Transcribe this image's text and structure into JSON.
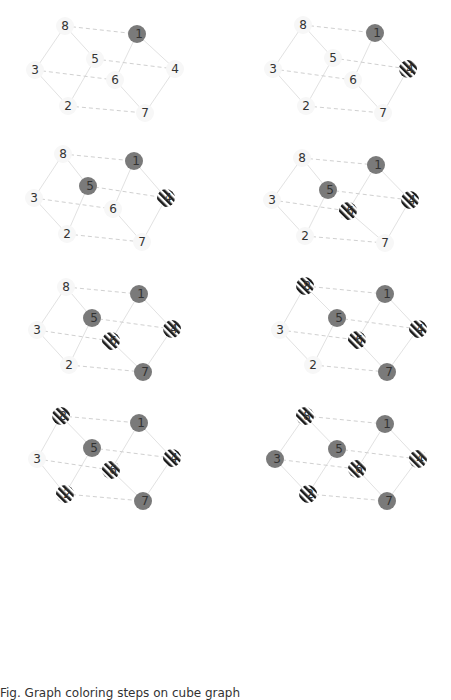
{
  "figure": {
    "caption": "Fig. Graph coloring steps on cube graph",
    "node_colors": {
      "filled": "#7a7a7a",
      "stripe_dark": "#1a1a1a",
      "stripe_light": "#ffffff",
      "halo": "#f7f7f7"
    },
    "edge_colors": {
      "solid": "#e2e2e2",
      "dashed": "#d0d0d0"
    },
    "edges": [
      {
        "from": "8",
        "to": "3",
        "style": "solid"
      },
      {
        "from": "8",
        "to": "5",
        "style": "solid"
      },
      {
        "from": "1",
        "to": "6",
        "style": "solid"
      },
      {
        "from": "1",
        "to": "4",
        "style": "solid"
      },
      {
        "from": "5",
        "to": "2",
        "style": "solid"
      },
      {
        "from": "3",
        "to": "2",
        "style": "solid"
      },
      {
        "from": "6",
        "to": "7",
        "style": "solid"
      },
      {
        "from": "4",
        "to": "7",
        "style": "solid"
      },
      {
        "from": "8",
        "to": "1",
        "style": "dashed"
      },
      {
        "from": "5",
        "to": "4",
        "style": "dashed"
      },
      {
        "from": "3",
        "to": "6",
        "style": "dashed"
      },
      {
        "from": "2",
        "to": "7",
        "style": "dashed"
      }
    ],
    "panels": [
      {
        "step": 1,
        "pos": {
          "8": [
            65,
            26
          ],
          "1": [
            137,
            34
          ],
          "5": [
            95,
            59
          ],
          "4": [
            175,
            69
          ],
          "3": [
            35,
            70
          ],
          "6": [
            115,
            80
          ],
          "2": [
            68,
            106
          ],
          "7": [
            145,
            113
          ]
        },
        "state": {
          "1": "filled"
        }
      },
      {
        "step": 2,
        "pos": {
          "8": [
            303,
            25
          ],
          "1": [
            375,
            33
          ],
          "5": [
            333,
            58
          ],
          "4": [
            408,
            69
          ],
          "3": [
            273,
            69
          ],
          "6": [
            353,
            80
          ],
          "2": [
            306,
            106
          ],
          "7": [
            383,
            113
          ]
        },
        "state": {
          "1": "filled",
          "4": "striped"
        }
      },
      {
        "step": 3,
        "pos": {
          "8": [
            63,
            154
          ],
          "1": [
            134,
            161
          ],
          "5": [
            88,
            186
          ],
          "4": [
            166,
            198
          ],
          "3": [
            34,
            198
          ],
          "6": [
            113,
            209
          ],
          "2": [
            67,
            234
          ],
          "7": [
            142,
            242
          ]
        },
        "state": {
          "1": "filled",
          "5": "filled",
          "4": "striped"
        }
      },
      {
        "step": 4,
        "pos": {
          "8": [
            302,
            158
          ],
          "1": [
            376,
            165
          ],
          "5": [
            328,
            190
          ],
          "4": [
            410,
            200
          ],
          "3": [
            272,
            200
          ],
          "6": [
            348,
            211
          ],
          "2": [
            305,
            236
          ],
          "7": [
            385,
            243
          ]
        },
        "state": {
          "1": "filled",
          "5": "filled",
          "4": "striped",
          "6": "striped"
        }
      },
      {
        "step": 5,
        "pos": {
          "8": [
            66,
            287
          ],
          "1": [
            139,
            294
          ],
          "5": [
            92,
            318
          ],
          "4": [
            172,
            329
          ],
          "3": [
            37,
            330
          ],
          "6": [
            111,
            341
          ],
          "2": [
            69,
            365
          ],
          "7": [
            143,
            372
          ]
        },
        "state": {
          "1": "filled",
          "5": "filled",
          "7": "filled",
          "4": "striped",
          "6": "striped"
        }
      },
      {
        "step": 6,
        "pos": {
          "8": [
            305,
            286
          ],
          "1": [
            385,
            294
          ],
          "5": [
            337,
            318
          ],
          "4": [
            418,
            329
          ],
          "3": [
            280,
            330
          ],
          "6": [
            357,
            340
          ],
          "2": [
            313,
            365
          ],
          "7": [
            387,
            372
          ]
        },
        "state": {
          "1": "filled",
          "5": "filled",
          "7": "filled",
          "4": "striped",
          "6": "striped",
          "8": "striped"
        }
      },
      {
        "step": 7,
        "pos": {
          "8": [
            61,
            416
          ],
          "1": [
            139,
            423
          ],
          "5": [
            92,
            448
          ],
          "4": [
            172,
            458
          ],
          "3": [
            37,
            459
          ],
          "6": [
            111,
            470
          ],
          "2": [
            65,
            494
          ],
          "7": [
            143,
            501
          ]
        },
        "state": {
          "1": "filled",
          "5": "filled",
          "7": "filled",
          "4": "striped",
          "6": "striped",
          "8": "striped",
          "2": "striped"
        }
      },
      {
        "step": 8,
        "pos": {
          "8": [
            305,
            416
          ],
          "1": [
            385,
            424
          ],
          "5": [
            337,
            449
          ],
          "4": [
            418,
            459
          ],
          "3": [
            275,
            459
          ],
          "6": [
            357,
            469
          ],
          "2": [
            308,
            494
          ],
          "7": [
            387,
            501
          ]
        },
        "state": {
          "1": "filled",
          "5": "filled",
          "7": "filled",
          "3": "filled",
          "4": "striped",
          "6": "striped",
          "8": "striped",
          "2": "striped"
        }
      }
    ]
  }
}
